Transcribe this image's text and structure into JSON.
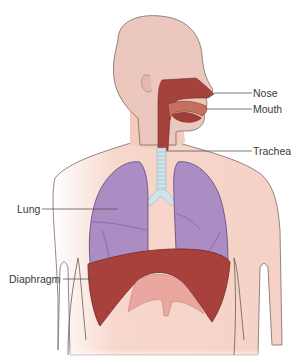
{
  "figure": {
    "labels": [
      {
        "id": "nose",
        "text": "Nose"
      },
      {
        "id": "mouth",
        "text": "Mouth"
      },
      {
        "id": "trachea",
        "text": "Trachea"
      },
      {
        "id": "lung",
        "text": "Lung"
      },
      {
        "id": "diaphragm",
        "text": "Diaphragm"
      }
    ]
  },
  "colors": {
    "skin": "#f6d2c6",
    "skin_outline": "#7a6a66",
    "head": "#e9c7bd",
    "lung": "#a98bc0",
    "lung_dark": "#8a6aa6",
    "diaphragm": "#a8403c",
    "airway": "#9e3d36",
    "trachea": "#cfe3ea",
    "leader_line": "#555555",
    "text": "#3a3a3a"
  }
}
